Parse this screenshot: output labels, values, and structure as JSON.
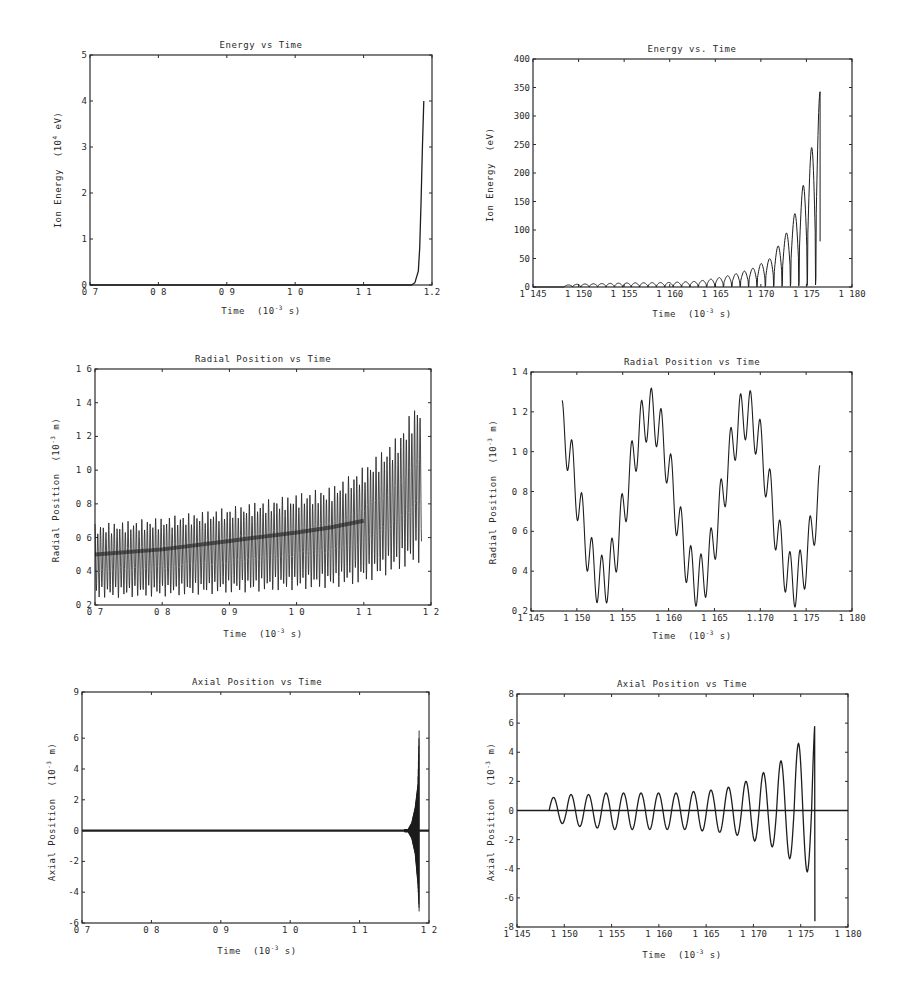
{
  "chart_data": [
    {
      "id": "energy_full",
      "type": "line",
      "title": "Energy vs Time",
      "xlabel": "Time (10^-3 s)",
      "ylabel": "Ion Energy (10^4 eV)",
      "xlim": [
        0.7,
        1.2
      ],
      "ylim": [
        0,
        5
      ],
      "xticks": [
        "0 7",
        "0 8",
        "0 9",
        "1 0",
        "1 1",
        "1.2"
      ],
      "xtick_values": [
        0.7,
        0.8,
        0.9,
        1.0,
        1.1,
        1.2
      ],
      "yticks": [
        "0",
        "1",
        "2",
        "3",
        "4",
        "5"
      ],
      "ytick_values": [
        0,
        1,
        2,
        3,
        4,
        5
      ],
      "grid": false,
      "series": [
        {
          "name": "ion energy",
          "x": [
            0.7,
            1.17,
            1.175,
            1.18,
            1.182,
            1.184,
            1.186,
            1.188
          ],
          "y": [
            0,
            0,
            0.05,
            0.3,
            0.8,
            1.8,
            3.0,
            4.0
          ]
        }
      ]
    },
    {
      "id": "energy_zoom",
      "type": "line",
      "title": "Energy vs. Time",
      "xlabel": "Time (10^-3 s)",
      "ylabel": "Ion Energy (eV)",
      "xlim": [
        1.145,
        1.18
      ],
      "ylim": [
        0,
        400
      ],
      "xticks": [
        "1 145",
        "1 150",
        "1 155",
        "1 160",
        "1 165",
        "1 170",
        "1 175",
        "1 180"
      ],
      "xtick_values": [
        1.145,
        1.15,
        1.155,
        1.16,
        1.165,
        1.17,
        1.175,
        1.18
      ],
      "yticks": [
        "0",
        "50",
        "100",
        "150",
        "200",
        "250",
        "300",
        "350",
        "400"
      ],
      "ytick_values": [
        0,
        50,
        100,
        150,
        200,
        250,
        300,
        350,
        400
      ],
      "grid": false,
      "series": [
        {
          "name": "ion energy (oscillating envelope)",
          "x": [
            1.1484,
            1.15,
            1.155,
            1.16,
            1.163,
            1.165,
            1.167,
            1.169,
            1.171,
            1.172,
            1.173,
            1.174,
            1.175,
            1.176,
            1.1765
          ],
          "y": [
            3,
            5,
            7,
            8,
            10,
            15,
            22,
            32,
            50,
            75,
            100,
            140,
            200,
            280,
            345
          ]
        }
      ]
    },
    {
      "id": "radial_full",
      "type": "line",
      "title": "Radial Position vs Time",
      "xlabel": "Time (10^-3 s)",
      "ylabel": "Radial Position (10^-3 m)",
      "xlim": [
        0.7,
        1.2
      ],
      "ylim": [
        0.2,
        1.6
      ],
      "xticks": [
        "0 7",
        "0 8",
        "0 9",
        "1 0",
        "1 1",
        "1 2"
      ],
      "xtick_values": [
        0.7,
        0.8,
        0.9,
        1.0,
        1.1,
        1.2
      ],
      "yticks": [
        "0 2",
        "0 4",
        "0 6",
        "0 8",
        "1 0",
        "1 2",
        "1 4",
        "1 6"
      ],
      "ytick_values": [
        0.2,
        0.4,
        0.6,
        0.8,
        1.0,
        1.2,
        1.4,
        1.6
      ],
      "grid": false,
      "series": [
        {
          "name": "upper envelope",
          "x": [
            0.7,
            0.8,
            0.9,
            1.0,
            1.05,
            1.1,
            1.15,
            1.18
          ],
          "y": [
            0.68,
            0.72,
            0.78,
            0.86,
            0.9,
            1.02,
            1.2,
            1.41
          ]
        },
        {
          "name": "lower envelope",
          "x": [
            0.7,
            0.8,
            0.9,
            1.0,
            1.05,
            1.1,
            1.15,
            1.18
          ],
          "y": [
            0.24,
            0.25,
            0.27,
            0.29,
            0.3,
            0.33,
            0.4,
            0.45
          ]
        },
        {
          "name": "mean",
          "x": [
            0.7,
            0.8,
            0.9,
            1.0,
            1.05,
            1.1
          ],
          "y": [
            0.5,
            0.53,
            0.58,
            0.63,
            0.66,
            0.7
          ]
        }
      ]
    },
    {
      "id": "radial_zoom",
      "type": "line",
      "title": "Radial Position vs Time",
      "xlabel": "Time (10^-3 s)",
      "ylabel": "Radial Position (10^-3 m)",
      "xlim": [
        1.145,
        1.18
      ],
      "ylim": [
        0.2,
        1.4
      ],
      "xticks": [
        "1 145",
        "1 150",
        "1 155",
        "1 160",
        "1 165",
        "1.170",
        "1 175",
        "1 180"
      ],
      "xtick_values": [
        1.145,
        1.15,
        1.155,
        1.16,
        1.165,
        1.17,
        1.175,
        1.18
      ],
      "yticks": [
        "0 2",
        "0 4",
        "0 6",
        "0 8",
        "1 0",
        "1 2",
        "1 4"
      ],
      "ytick_values": [
        0.2,
        0.4,
        0.6,
        0.8,
        1.0,
        1.2,
        1.4
      ],
      "grid": false,
      "series": [
        {
          "name": "radial position",
          "slow_period": 0.0105,
          "fast_period": 0.00108,
          "slow_center": 0.77,
          "slow_amplitude": 0.42,
          "fast_amplitude": 0.13,
          "x_start": 1.1484,
          "x_end": 1.1765,
          "local_maxima_y": [
            1.22,
            1.3,
            1.22
          ],
          "local_minima_y": [
            0.29,
            0.29,
            0.29
          ]
        }
      ]
    },
    {
      "id": "axial_full",
      "type": "line",
      "title": "Axial Position vs Time",
      "xlabel": "Time (10^-3 s)",
      "ylabel": "Axial Position (10^-3 m)",
      "xlim": [
        0.7,
        1.2
      ],
      "ylim": [
        -6,
        9
      ],
      "xticks": [
        "0 7",
        "0 8",
        "0 9",
        "1 0",
        "1 1",
        "1 2"
      ],
      "xtick_values": [
        0.7,
        0.8,
        0.9,
        1.0,
        1.1,
        1.2
      ],
      "yticks": [
        "-6",
        "-4",
        "-2",
        "0",
        "2",
        "4",
        "6",
        "9"
      ],
      "ytick_values": [
        -6,
        -4,
        -2,
        0,
        2,
        4,
        6,
        9
      ],
      "grid": false,
      "series": [
        {
          "name": "axial position",
          "x": [
            0.7,
            1.17,
            1.175,
            1.18,
            1.184,
            1.186
          ],
          "y_max": [
            0.1,
            0.1,
            0.5,
            1.5,
            3.0,
            7.0
          ],
          "y_min": [
            -0.1,
            -0.1,
            -0.5,
            -1.5,
            -3.5,
            -5.5
          ]
        }
      ]
    },
    {
      "id": "axial_zoom",
      "type": "line",
      "title": "Axial Position vs Time",
      "xlabel": "Time (10^-3 s)",
      "ylabel": "Axial Position (10^-3 m)",
      "xlim": [
        1.145,
        1.18
      ],
      "ylim": [
        -8,
        8
      ],
      "xticks": [
        "1 145",
        "1 150",
        "1 155",
        "1 160",
        "1 165",
        "1 170",
        "1 175",
        "1 180"
      ],
      "xtick_values": [
        1.145,
        1.15,
        1.155,
        1.16,
        1.165,
        1.17,
        1.175,
        1.18
      ],
      "yticks": [
        "-8",
        "-6",
        "-4",
        "-2",
        "0",
        "2",
        "4",
        "6",
        "8"
      ],
      "ytick_values": [
        -8,
        -6,
        -4,
        -2,
        0,
        2,
        4,
        6,
        8
      ],
      "grid": false,
      "series": [
        {
          "name": "axial position",
          "x_start": 1.1484,
          "x_end": 1.1765,
          "period": 0.00185,
          "peaks": [
            0.9,
            1.1,
            1.1,
            1.2,
            1.2,
            1.2,
            1.2,
            1.2,
            1.3,
            1.4,
            1.6,
            2.0,
            2.6,
            3.4,
            4.6,
            6.5
          ],
          "troughs": [
            -0.9,
            -1.1,
            -1.2,
            -1.3,
            -1.3,
            -1.3,
            -1.3,
            -1.3,
            -1.4,
            -1.5,
            -1.7,
            -2.1,
            -2.5,
            -3.3,
            -4.2,
            -5.7,
            -7.6
          ]
        }
      ]
    }
  ],
  "panels": [
    {
      "title": "Energy vs Time",
      "xlabel": "Time",
      "xunit": "(10",
      "xexp": "-3",
      "xunit2": " s)",
      "ylabel": "Ion Energy",
      "yunit": "(10",
      "yexp": "4",
      "yunit2": " eV)"
    },
    {
      "title": "Energy vs. Time",
      "xlabel": "Time",
      "xunit": "(10",
      "xexp": "-3",
      "xunit2": " s)",
      "ylabel": "Ion Energy",
      "yunit": "(eV)",
      "yexp": "",
      "yunit2": ""
    },
    {
      "title": "Radial Position vs Time",
      "xlabel": "Time",
      "xunit": "(10",
      "xexp": "-3",
      "xunit2": " s)",
      "ylabel": "Radial Position",
      "yunit": "(10",
      "yexp": "-3",
      "yunit2": " m)"
    },
    {
      "title": "Radial Position vs Time",
      "xlabel": "Time",
      "xunit": "(10",
      "xexp": "-3",
      "xunit2": " s)",
      "ylabel": "Radial Position",
      "yunit": "(10",
      "yexp": "-3",
      "yunit2": " m)"
    },
    {
      "title": "Axial Position vs Time",
      "xlabel": "Time",
      "xunit": "(10",
      "xexp": "-3",
      "xunit2": " s)",
      "ylabel": "Axial Position",
      "yunit": "(10",
      "yexp": "-3",
      "yunit2": " m)"
    },
    {
      "title": "Axial Position vs Time",
      "xlabel": "Time",
      "xunit": "(10",
      "xexp": "-3",
      "xunit2": " s)",
      "ylabel": "Axial Position",
      "yunit": "(10",
      "yexp": "-3",
      "yunit2": " m)"
    }
  ],
  "style": {
    "line_color": "#1e1e1e",
    "frame_color": "#2a2a2a",
    "background": "#ffffff"
  }
}
